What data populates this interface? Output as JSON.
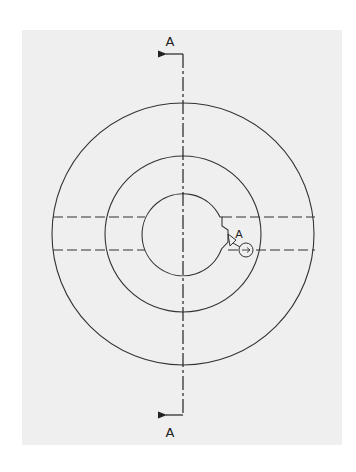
{
  "drawing": {
    "type": "technical-drawing",
    "view": "front view with section indicator",
    "background_color": "#efefef",
    "line_color": "#333333",
    "center": {
      "x": 183,
      "y": 234
    },
    "circles": [
      {
        "name": "outer",
        "r": 135
      },
      {
        "name": "middle",
        "r": 81
      },
      {
        "name": "inner-bore",
        "r": 41
      }
    ],
    "hidden_lines_y": [
      217,
      250
    ],
    "section": {
      "label_top": "A",
      "label_bottom": "A",
      "arrow_direction": "left"
    },
    "datum_feature": {
      "label": "A",
      "marker_glyph": "⇥"
    }
  }
}
